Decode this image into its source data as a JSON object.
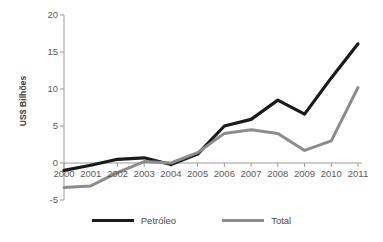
{
  "chart_data": {
    "type": "line",
    "title": "",
    "xlabel": "",
    "ylabel": "US$ Bilhões",
    "categories": [
      "2000",
      "2001",
      "2002",
      "2003",
      "2004",
      "2005",
      "2006",
      "2007",
      "2008",
      "2009",
      "2010",
      "2011"
    ],
    "x": [
      2000,
      2001,
      2002,
      2003,
      2004,
      2005,
      2006,
      2007,
      2008,
      2009,
      2010,
      2011
    ],
    "ylim": [
      -5,
      20
    ],
    "yticks": [
      -5,
      0,
      5,
      10,
      15,
      20
    ],
    "ytick_labels": [
      "-5",
      "0",
      "5",
      "10",
      "15",
      "20"
    ],
    "grid": false,
    "legend_position": "bottom",
    "series": [
      {
        "name": "Petróleo",
        "color": "#1a1a1a",
        "line_width": 3.2,
        "values": [
          -1.0,
          -0.3,
          0.5,
          0.7,
          -0.2,
          1.2,
          5.0,
          5.9,
          8.5,
          6.6,
          11.5,
          16.1
        ]
      },
      {
        "name": "Total",
        "color": "#8c8c8c",
        "line_width": 3.0,
        "values": [
          -3.3,
          -3.1,
          -1.3,
          0.2,
          0.0,
          1.4,
          4.0,
          4.5,
          4.0,
          1.7,
          3.0,
          10.2
        ]
      }
    ]
  },
  "axis": {
    "y_title": "US$ Bilhões",
    "axis_color": "#9a9a9a",
    "zero_line_color": "#9a9a9a"
  },
  "legend": {
    "items": [
      {
        "label": "Petróleo",
        "color": "#1a1a1a"
      },
      {
        "label": "Total",
        "color": "#8c8c8c"
      }
    ]
  }
}
